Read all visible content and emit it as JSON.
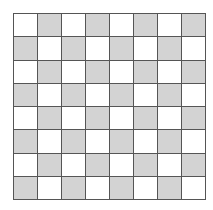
{
  "board": {
    "rows": 8,
    "cols": 8,
    "top_left": "light",
    "colors": {
      "light": "#ffffff",
      "dark": "#d3d3d3",
      "grid_line": "#555555"
    }
  }
}
